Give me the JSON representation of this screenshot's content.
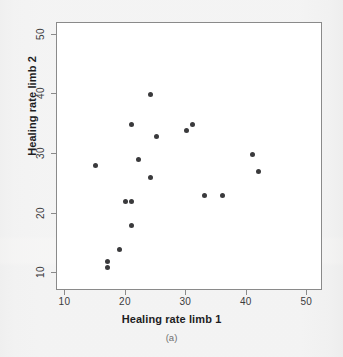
{
  "figure": {
    "caption": "(a)",
    "accent_color": "#3a3a3c",
    "frame_color": "#8a8a8a",
    "plot_background": "#ffffff",
    "page_background": "#f3f3f3"
  },
  "chart_data": {
    "type": "scatter",
    "title": "",
    "xlabel": "Healing rate limb 1",
    "ylabel": "Healing rate limb 2",
    "xlim": [
      8.6,
      52.6
    ],
    "ylim": [
      7.0,
      52.0
    ],
    "xticks": [
      10,
      20,
      30,
      40,
      50
    ],
    "yticks": [
      10,
      20,
      30,
      40,
      50
    ],
    "xticklabels": [
      "10",
      "20",
      "30",
      "40",
      "50"
    ],
    "yticklabels": [
      "10",
      "20",
      "30",
      "40",
      "50"
    ],
    "grid": false,
    "legend": false,
    "marker": "filled-circle",
    "marker_color": "#3a3a3c",
    "points": [
      {
        "x": 15,
        "y": 28
      },
      {
        "x": 17,
        "y": 12
      },
      {
        "x": 17,
        "y": 11
      },
      {
        "x": 19,
        "y": 14
      },
      {
        "x": 20,
        "y": 22
      },
      {
        "x": 21,
        "y": 22
      },
      {
        "x": 21,
        "y": 18
      },
      {
        "x": 21,
        "y": 35
      },
      {
        "x": 22,
        "y": 29
      },
      {
        "x": 24,
        "y": 40
      },
      {
        "x": 24,
        "y": 26
      },
      {
        "x": 25,
        "y": 33
      },
      {
        "x": 30,
        "y": 34
      },
      {
        "x": 31,
        "y": 35
      },
      {
        "x": 33,
        "y": 23
      },
      {
        "x": 36,
        "y": 23
      },
      {
        "x": 41,
        "y": 30
      },
      {
        "x": 42,
        "y": 27
      }
    ]
  }
}
